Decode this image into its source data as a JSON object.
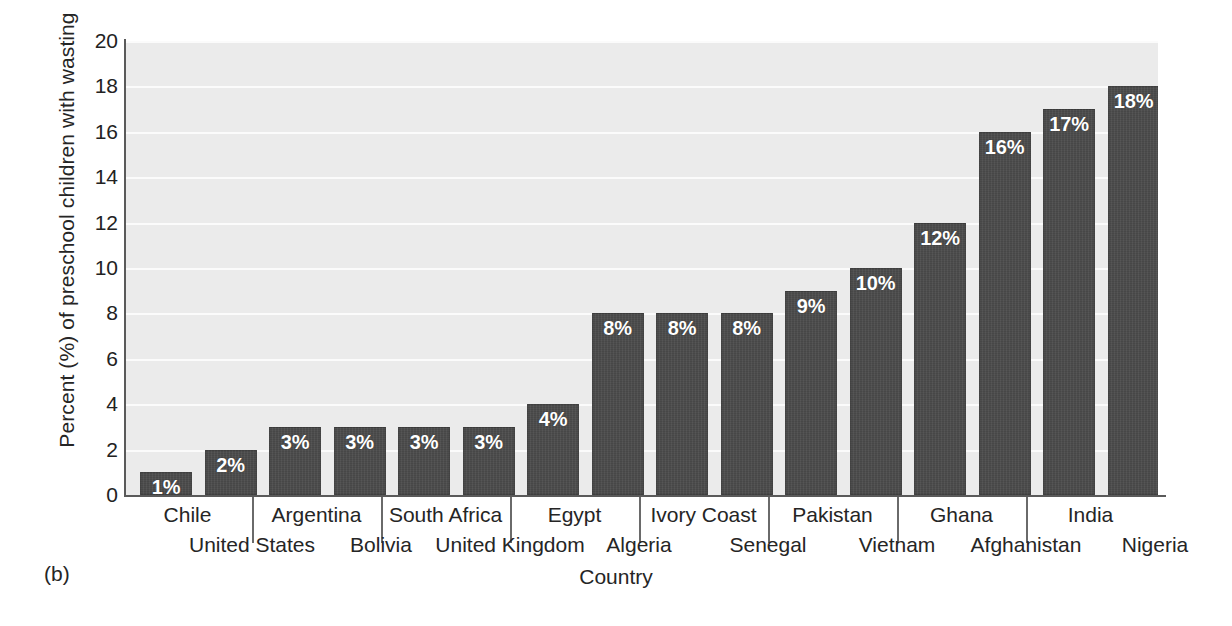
{
  "figure": {
    "panel_caption": "(b)"
  },
  "chart_data": {
    "type": "bar",
    "title": "",
    "xlabel": "Country",
    "ylabel": "Percent (%) of preschool children with wasting",
    "ylim": [
      0,
      20
    ],
    "ytick_step": 2,
    "yticks": [
      0,
      2,
      4,
      6,
      8,
      10,
      12,
      14,
      16,
      18,
      20
    ],
    "ytick_labels": [
      "0",
      "2",
      "4",
      "6",
      "8",
      "10",
      "12",
      "14",
      "16",
      "18",
      "20"
    ],
    "grid": true,
    "grid_axis": "y",
    "legend": false,
    "bar_color": "#474747",
    "plot_background": "#ebebeb",
    "gridline_color": "#fbfbfb",
    "value_label_color": "#ffffff",
    "value_label_suffix": "%",
    "categories": [
      "Chile",
      "United States",
      "Argentina",
      "Bolivia",
      "South Africa",
      "United Kingdom",
      "Egypt",
      "Algeria",
      "Ivory Coast",
      "Senegal",
      "Pakistan",
      "Vietnam",
      "Ghana",
      "Afghanistan",
      "India",
      "Nigeria"
    ],
    "values": [
      1,
      2,
      3,
      3,
      3,
      3,
      4,
      8,
      8,
      8,
      9,
      10,
      12,
      16,
      17,
      18
    ],
    "value_labels": [
      "1%",
      "2%",
      "3%",
      "3%",
      "3%",
      "3%",
      "4%",
      "8%",
      "8%",
      "8%",
      "9%",
      "10%",
      "12%",
      "16%",
      "17%",
      "18%"
    ],
    "label_rows": [
      "top",
      "bottom",
      "top",
      "bottom",
      "top",
      "bottom",
      "top",
      "bottom",
      "top",
      "bottom",
      "top",
      "bottom",
      "top",
      "bottom",
      "top",
      "bottom"
    ]
  }
}
